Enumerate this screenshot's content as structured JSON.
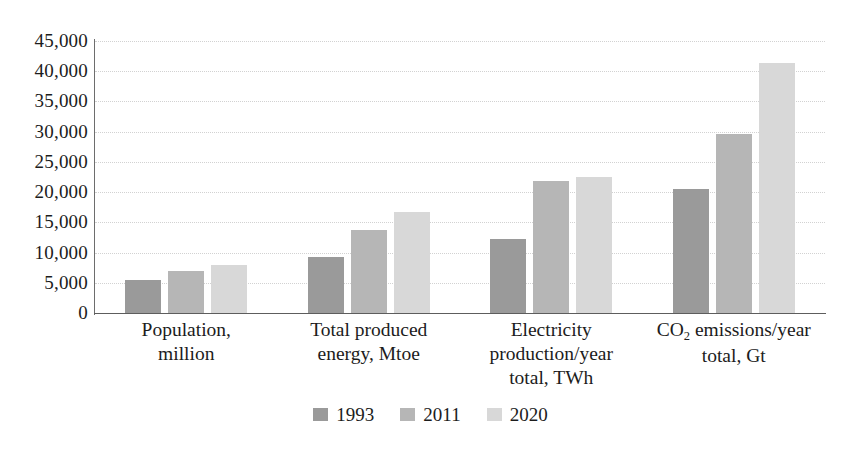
{
  "chart_data": {
    "type": "bar",
    "title": "",
    "subtitle": "",
    "xlabel": "",
    "ylabel": "",
    "ylim": [
      0,
      45000
    ],
    "ytick_step": 5000,
    "grid": true,
    "legend_position": "bottom",
    "categories": [
      "Population, million",
      "Total produced energy, Mtoe",
      "Electricity production/year total, TWh",
      "CO2 emissions/year total, Gt"
    ],
    "category_labels": [
      {
        "line1": "Population,",
        "line2": "million",
        "line3": ""
      },
      {
        "line1": "Total produced",
        "line2": "energy, Mtoe",
        "line3": ""
      },
      {
        "line1": "Electricity",
        "line2": "production/year",
        "line3": "total, TWh"
      },
      {
        "line1_pre": "CO",
        "line1_sub": "2",
        "line1_post": " emissions/year",
        "line2": "total, Gt",
        "line3": ""
      }
    ],
    "ytick_labels": [
      "45,000",
      "40,000",
      "35,000",
      "30,000",
      "25,000",
      "20,000",
      "15,000",
      "10,000",
      "5,000",
      "0"
    ],
    "ytick_values": [
      45000,
      40000,
      35000,
      30000,
      25000,
      20000,
      15000,
      10000,
      5000,
      0
    ],
    "series": [
      {
        "name": "1993",
        "color": "#9a9a9a",
        "values": [
          5500,
          9200,
          12200,
          20500
        ]
      },
      {
        "name": "2011",
        "color": "#b6b6b6",
        "values": [
          6900,
          13700,
          21800,
          29600
        ]
      },
      {
        "name": "2020",
        "color": "#d8d8d8",
        "values": [
          7900,
          16700,
          22500,
          41400
        ]
      }
    ],
    "legend": [
      {
        "label": "1993",
        "color": "#9a9a9a"
      },
      {
        "label": "2011",
        "color": "#b6b6b6"
      },
      {
        "label": "2020",
        "color": "#d8d8d8"
      }
    ],
    "axis_color": "#5d5d5d",
    "gridline_color": "#d2d2d2",
    "background": "#ffffff"
  }
}
